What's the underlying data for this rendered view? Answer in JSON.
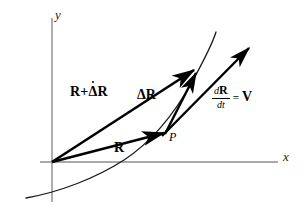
{
  "figure": {
    "type": "vector-diagram",
    "width": 306,
    "height": 220,
    "background": "#ffffff"
  },
  "colors": {
    "axis": "#8c8c8c",
    "curve": "#1a1a1a",
    "vector": "#000000",
    "text": "#000000"
  },
  "axes": {
    "x": {
      "label": "x",
      "origin": [
        52,
        162
      ],
      "end": [
        278,
        162
      ]
    },
    "y": {
      "label": "y",
      "top": [
        52,
        18
      ],
      "bottom": [
        52,
        202
      ]
    }
  },
  "curve": {
    "name": "particle-path",
    "description": "upward-curving trajectory through the first quadrant",
    "points": [
      [
        26,
        198
      ],
      [
        60,
        190
      ],
      [
        95,
        178
      ],
      [
        125,
        162
      ],
      [
        150,
        144
      ],
      [
        168,
        128
      ],
      [
        186,
        105
      ],
      [
        202,
        75
      ],
      [
        212,
        48
      ],
      [
        216,
        32
      ]
    ]
  },
  "points": [
    {
      "label": "P",
      "at": [
        164,
        134
      ],
      "name": "point-p"
    }
  ],
  "vectors": [
    {
      "name": "position-vector-R",
      "label": "R",
      "label_html": "<b>R</b>",
      "from": [
        52,
        162
      ],
      "to": [
        166,
        133
      ]
    },
    {
      "name": "position-vector-R-plus-delta-R",
      "label": "R+Δ̇R",
      "from": [
        52,
        162
      ],
      "to": [
        196,
        69
      ]
    },
    {
      "name": "increment-vector-delta-R",
      "label": "ΔR",
      "from": [
        165,
        133
      ],
      "to": [
        197,
        72
      ]
    },
    {
      "name": "velocity-vector-dRdt",
      "label": "dR/dt = V",
      "from": [
        163,
        135
      ],
      "to": [
        250,
        47
      ]
    }
  ],
  "labels": {
    "r_plus_delta_r": {
      "lead": "R",
      "plus": "+",
      "delta": "Δ",
      "tail": "R"
    },
    "delta_r": "ΔR",
    "r": "R",
    "p": "P",
    "y_axis": "y",
    "x_axis": "x",
    "derivative": {
      "numerator_d": "d",
      "numerator_vec": "R",
      "denominator": "dt",
      "equals": "=",
      "velocity": "V"
    }
  }
}
